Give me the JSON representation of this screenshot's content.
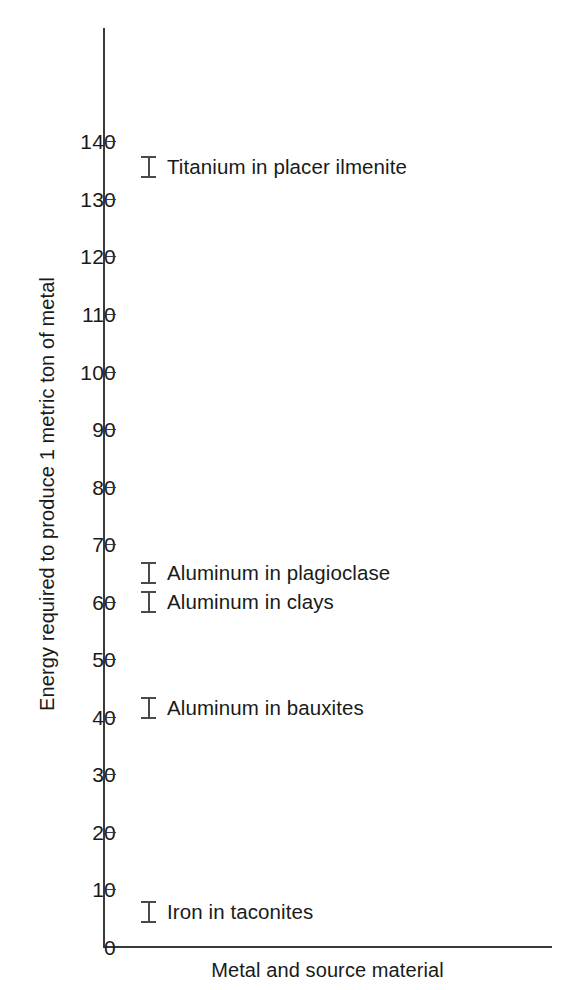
{
  "chart_data": {
    "type": "scatter",
    "title": "",
    "xlabel": "Metal and source material",
    "ylabel": "Energy required to produce 1 metric ton of metal",
    "ylim": [
      0,
      145
    ],
    "yticks": [
      0,
      10,
      20,
      30,
      40,
      50,
      60,
      70,
      80,
      90,
      100,
      110,
      120,
      130,
      140
    ],
    "ytick_labels": [
      "0",
      "10",
      "20",
      "30",
      "40",
      "50",
      "60",
      "70",
      "80",
      "90",
      "100",
      "110",
      "120",
      "130",
      "140"
    ],
    "xticks": [],
    "xtick_labels": [],
    "grid": false,
    "legend": null,
    "marker_style": "i-beam",
    "categories": [
      "Titanium in placer ilmenite",
      "Aluminum in plagioclase",
      "Aluminum in clays",
      "Aluminum in bauxites",
      "Iron in taconites"
    ],
    "values": [
      135.5,
      65,
      60,
      41.5,
      6
    ],
    "points": [
      {
        "label": "Titanium in placer ilmenite",
        "value": 135.5
      },
      {
        "label": "Aluminum in plagioclase",
        "value": 65
      },
      {
        "label": "Aluminum in clays",
        "value": 60
      },
      {
        "label": "Aluminum in bauxites",
        "value": 41.5
      },
      {
        "label": "Iron in taconites",
        "value": 6
      }
    ],
    "colors": {
      "axis": "#3a3a3a",
      "marker": "#4a4a4a",
      "text": "#1a1a1a",
      "background": "#ffffff"
    }
  }
}
